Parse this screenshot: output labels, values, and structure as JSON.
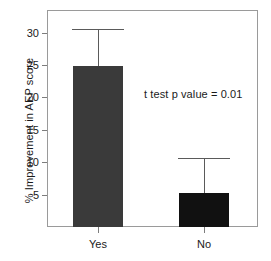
{
  "chart_data": {
    "type": "bar",
    "title": "",
    "xlabel": "",
    "ylabel": "% Improvement in AEP score",
    "categories": [
      "Yes",
      "No"
    ],
    "values": [
      24.9,
      5.2
    ],
    "errors_upper": [
      30.5,
      10.6
    ],
    "ylim": [
      0,
      33.5
    ],
    "yticks": [
      5,
      10,
      15,
      20,
      25,
      30
    ],
    "ytick_labels": [
      "5",
      "10",
      "15",
      "20",
      "25",
      "30"
    ],
    "grid": false,
    "legend": false,
    "annotations": [
      {
        "text": "t test p value = 0.01",
        "x": 0.46,
        "y": 20.4
      }
    ],
    "bar_colors": [
      "#3a3a3a",
      "#111111"
    ],
    "frame_color": "#9a9a9a",
    "error_bar_color": "#5a5a5a",
    "background": "#ffffff"
  },
  "axes": {
    "y_title": "% Improvement in AEP score",
    "y_tick_labels": [
      "30",
      "25",
      "20",
      "15",
      "10",
      "5"
    ],
    "x_tick_labels": [
      "Yes",
      "No"
    ]
  },
  "annotation": {
    "p_value_text": "t test p value = 0.01"
  }
}
